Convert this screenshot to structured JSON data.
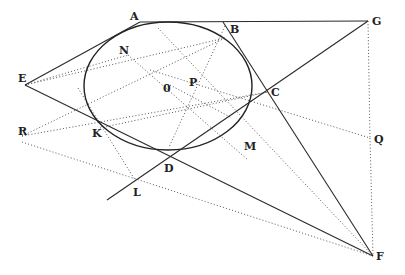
{
  "diagram": {
    "type": "geometry-figure",
    "points": {
      "A": {
        "label": "A",
        "x": 140,
        "y": 22
      },
      "B": {
        "label": "B",
        "x": 223,
        "y": 22
      },
      "G": {
        "label": "G",
        "x": 368,
        "y": 21
      },
      "E": {
        "label": "E",
        "x": 25,
        "y": 85
      },
      "N": {
        "label": "N",
        "x": 128,
        "y": 55
      },
      "O": {
        "label": "0",
        "x": 170,
        "y": 85
      },
      "P": {
        "label": "P",
        "x": 193,
        "y": 79
      },
      "C": {
        "label": "C",
        "x": 268,
        "y": 92
      },
      "R": {
        "label": "R",
        "x": 22,
        "y": 136
      },
      "K": {
        "label": "K",
        "x": 100,
        "y": 128
      },
      "M": {
        "label": "M",
        "x": 248,
        "y": 165
      },
      "Q": {
        "label": "Q",
        "x": 370,
        "y": 138
      },
      "D": {
        "label": "D",
        "x": 169,
        "y": 147
      },
      "L": {
        "label": "L",
        "x": 135,
        "y": 180
      },
      "F": {
        "label": "F",
        "x": 373,
        "y": 256
      }
    },
    "ellipse": {
      "cx": 168,
      "cy": 86,
      "rx": 84,
      "ry": 64
    },
    "labels": [
      "A",
      "B",
      "G",
      "E",
      "N",
      "0",
      "P",
      "C",
      "R",
      "K",
      "M",
      "Q",
      "D",
      "L",
      "F"
    ]
  }
}
